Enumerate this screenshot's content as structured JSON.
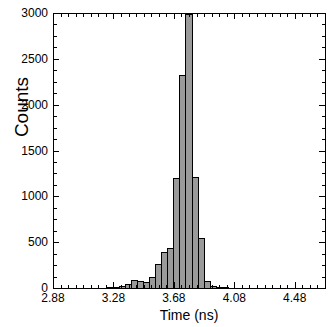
{
  "chart_data": {
    "type": "bar",
    "title": "",
    "subtitle": "",
    "xlabel": "Time (ns)",
    "ylabel": "Counts",
    "xlim": [
      2.88,
      4.68
    ],
    "ylim": [
      0,
      3000
    ],
    "grid": false,
    "legend": null,
    "bin_width": 0.04,
    "bar_fill_color": "#9a9a9a",
    "bar_edge_color": "#000000",
    "axis_color": "#000000",
    "background_color": "#ffffff",
    "xticks": [
      2.88,
      3.28,
      3.68,
      4.08,
      4.48
    ],
    "xtick_labels": [
      "2.88",
      "3.28",
      "3.68",
      "4.08",
      "4.48"
    ],
    "xminor_tick_step": 0.05,
    "yticks": [
      0,
      500,
      1000,
      1500,
      2000,
      2500,
      3000
    ],
    "ytick_labels": [
      "0",
      "500",
      "1000",
      "1500",
      "2000",
      "2500",
      "3000"
    ],
    "yminor_tick_step": 125,
    "x": [
      2.9,
      2.94,
      2.98,
      3.02,
      3.06,
      3.1,
      3.14,
      3.18,
      3.22,
      3.26,
      3.3,
      3.34,
      3.38,
      3.42,
      3.46,
      3.5,
      3.54,
      3.58,
      3.62,
      3.66,
      3.7,
      3.74,
      3.78,
      3.82,
      3.86,
      3.9,
      3.94,
      3.98,
      4.02,
      4.06,
      4.1,
      4.14,
      4.18,
      4.22,
      4.26,
      4.3
    ],
    "values": [
      0,
      0,
      0,
      0,
      0,
      0,
      0,
      0,
      0,
      8,
      10,
      14,
      40,
      80,
      75,
      60,
      110,
      255,
      385,
      430,
      1195,
      2320,
      2980,
      1205,
      540,
      70,
      12,
      8,
      5,
      0,
      0,
      0,
      0,
      0,
      0,
      0
    ],
    "annotations": []
  },
  "axes": {
    "frame": {
      "left": 53,
      "top": 13,
      "right": 325,
      "bottom": 288
    },
    "ticks_direction": "inward",
    "top_axis_ticks": true,
    "right_axis_ticks": true
  }
}
